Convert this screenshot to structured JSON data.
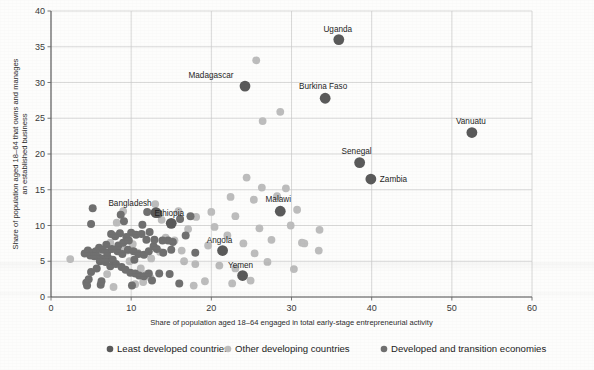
{
  "chart_data": {
    "type": "scatter",
    "title": "",
    "xlabel": "Share of population aged 18–64 engaged in total early-stage entrepreneurial activity",
    "ylabel": "Share of population aged 18–64 that owns and manages an established business",
    "ylabel_line1": "Share of population aged 18–64 that owns and manages",
    "ylabel_line2": "an established business",
    "xlim": [
      0,
      60
    ],
    "ylim": [
      0,
      40
    ],
    "xticks": [
      0,
      10,
      20,
      30,
      40,
      50,
      60
    ],
    "yticks": [
      0,
      5,
      10,
      15,
      20,
      25,
      30,
      35,
      40
    ],
    "grid": true,
    "legend_position": "bottom",
    "series": [
      {
        "name": "Least developed countries",
        "color": "#5a5a5a",
        "marker_size": 5.4,
        "points": [
          {
            "label": "Madagascar",
            "x": 24.2,
            "y": 29.5,
            "label_dx": -34,
            "label_dy": -8
          },
          {
            "label": "Uganda",
            "x": 35.9,
            "y": 36.0,
            "label_dx": -1,
            "label_dy": -8
          },
          {
            "label": "Burkina Faso",
            "x": 34.2,
            "y": 27.8,
            "label_dx": -2,
            "label_dy": -9
          },
          {
            "label": "Vanuatu",
            "x": 52.5,
            "y": 23.0,
            "label_dx": -1,
            "label_dy": -9
          },
          {
            "label": "Senegal",
            "x": 38.5,
            "y": 18.8,
            "label_dx": -3,
            "label_dy": -9
          },
          {
            "label": "Zambia",
            "x": 39.9,
            "y": 16.5,
            "label_dx": 9,
            "label_dy": 3
          },
          {
            "label": "Malawi",
            "x": 28.6,
            "y": 12.0,
            "label_dx": -2,
            "label_dy": -9
          },
          {
            "label": "Bangladesh",
            "x": 13.1,
            "y": 11.8,
            "label_dx": -26,
            "label_dy": -7
          },
          {
            "label": "Ethiopia",
            "x": 15.0,
            "y": 10.3,
            "label_dx": -2,
            "label_dy": -7
          },
          {
            "label": "Angola",
            "x": 21.4,
            "y": 6.5,
            "label_dx": -3,
            "label_dy": -8
          },
          {
            "label": "Yemen",
            "x": 23.9,
            "y": 3.0,
            "label_dx": -2,
            "label_dy": -8
          }
        ]
      },
      {
        "name": "Other developing countries",
        "color": "#bdbdbd",
        "marker_size": 3.9,
        "points": [
          {
            "x": 25.6,
            "y": 33.1
          },
          {
            "x": 28.6,
            "y": 25.9
          },
          {
            "x": 26.4,
            "y": 24.6
          },
          {
            "x": 33.5,
            "y": 9.4
          },
          {
            "x": 33.4,
            "y": 6.5
          },
          {
            "x": 31.3,
            "y": 7.6
          },
          {
            "x": 29.3,
            "y": 15.2
          },
          {
            "x": 28.2,
            "y": 14.1
          },
          {
            "x": 30.7,
            "y": 12.2
          },
          {
            "x": 29.9,
            "y": 10.0
          },
          {
            "x": 31.6,
            "y": 7.5
          },
          {
            "x": 26.3,
            "y": 15.3
          },
          {
            "x": 25.3,
            "y": 13.6
          },
          {
            "x": 24.4,
            "y": 16.7
          },
          {
            "x": 22.4,
            "y": 14.0
          },
          {
            "x": 23.0,
            "y": 11.3
          },
          {
            "x": 26.0,
            "y": 9.6
          },
          {
            "x": 27.5,
            "y": 8.0
          },
          {
            "x": 25.4,
            "y": 6.1
          },
          {
            "x": 22.0,
            "y": 8.6
          },
          {
            "x": 20.4,
            "y": 9.8
          },
          {
            "x": 19.6,
            "y": 7.2
          },
          {
            "x": 21.0,
            "y": 4.4
          },
          {
            "x": 23.0,
            "y": 4.0
          },
          {
            "x": 24.9,
            "y": 2.3
          },
          {
            "x": 22.6,
            "y": 1.9
          },
          {
            "x": 19.2,
            "y": 2.2
          },
          {
            "x": 17.8,
            "y": 1.6
          },
          {
            "x": 16.6,
            "y": 5.0
          },
          {
            "x": 18.0,
            "y": 4.6
          },
          {
            "x": 17.1,
            "y": 9.5
          },
          {
            "x": 18.1,
            "y": 11.2
          },
          {
            "x": 15.9,
            "y": 12.0
          },
          {
            "x": 14.3,
            "y": 8.3
          },
          {
            "x": 13.6,
            "y": 6.3
          },
          {
            "x": 12.5,
            "y": 5.4
          },
          {
            "x": 11.9,
            "y": 3.2
          },
          {
            "x": 12.4,
            "y": 2.7
          },
          {
            "x": 11.5,
            "y": 2.1
          },
          {
            "x": 10.5,
            "y": 1.8
          },
          {
            "x": 11.2,
            "y": 4.0
          },
          {
            "x": 10.8,
            "y": 6.2
          },
          {
            "x": 10.2,
            "y": 7.4
          },
          {
            "x": 9.5,
            "y": 6.5
          },
          {
            "x": 9.8,
            "y": 5.0
          },
          {
            "x": 8.9,
            "y": 6.9
          },
          {
            "x": 8.2,
            "y": 10.4
          },
          {
            "x": 9.0,
            "y": 12.0
          },
          {
            "x": 7.4,
            "y": 7.6
          },
          {
            "x": 7.0,
            "y": 3.2
          },
          {
            "x": 7.8,
            "y": 1.4
          },
          {
            "x": 2.4,
            "y": 5.3
          },
          {
            "x": 13.8,
            "y": 10.8
          },
          {
            "x": 15.4,
            "y": 7.9
          },
          {
            "x": 16.3,
            "y": 6.5
          },
          {
            "x": 20.0,
            "y": 11.9
          },
          {
            "x": 24.0,
            "y": 7.5
          },
          {
            "x": 27.0,
            "y": 4.9
          },
          {
            "x": 30.3,
            "y": 3.9
          },
          {
            "x": 13.0,
            "y": 13.0
          }
        ]
      },
      {
        "name": "Developed and transition economies",
        "color": "#707070",
        "marker_size": 4.0,
        "points": [
          {
            "x": 5.2,
            "y": 12.4
          },
          {
            "x": 5.0,
            "y": 10.2
          },
          {
            "x": 8.7,
            "y": 11.5
          },
          {
            "x": 9.1,
            "y": 10.6
          },
          {
            "x": 11.4,
            "y": 10.1
          },
          {
            "x": 12.3,
            "y": 9.1
          },
          {
            "x": 16.1,
            "y": 10.9
          },
          {
            "x": 17.4,
            "y": 11.3
          },
          {
            "x": 16.8,
            "y": 8.6
          },
          {
            "x": 18.0,
            "y": 6.2
          },
          {
            "x": 14.6,
            "y": 7.9
          },
          {
            "x": 15.2,
            "y": 7.7
          },
          {
            "x": 13.9,
            "y": 7.9
          },
          {
            "x": 12.8,
            "y": 7.1
          },
          {
            "x": 11.9,
            "y": 8.0
          },
          {
            "x": 11.3,
            "y": 8.8
          },
          {
            "x": 10.6,
            "y": 8.7
          },
          {
            "x": 10.0,
            "y": 9.0
          },
          {
            "x": 9.4,
            "y": 8.4
          },
          {
            "x": 8.6,
            "y": 8.9
          },
          {
            "x": 8.0,
            "y": 8.5
          },
          {
            "x": 7.5,
            "y": 8.8
          },
          {
            "x": 6.9,
            "y": 7.3
          },
          {
            "x": 6.4,
            "y": 6.6
          },
          {
            "x": 6.0,
            "y": 6.9
          },
          {
            "x": 5.6,
            "y": 6.4
          },
          {
            "x": 5.1,
            "y": 6.2
          },
          {
            "x": 4.6,
            "y": 6.5
          },
          {
            "x": 4.2,
            "y": 6.1
          },
          {
            "x": 4.9,
            "y": 5.8
          },
          {
            "x": 5.4,
            "y": 5.7
          },
          {
            "x": 5.9,
            "y": 5.6
          },
          {
            "x": 6.5,
            "y": 5.4
          },
          {
            "x": 7.1,
            "y": 5.5
          },
          {
            "x": 7.7,
            "y": 5.2
          },
          {
            "x": 8.3,
            "y": 6.4
          },
          {
            "x": 8.9,
            "y": 6.0
          },
          {
            "x": 9.6,
            "y": 6.6
          },
          {
            "x": 10.3,
            "y": 6.4
          },
          {
            "x": 10.9,
            "y": 6.0
          },
          {
            "x": 11.6,
            "y": 5.9
          },
          {
            "x": 12.2,
            "y": 6.4
          },
          {
            "x": 13.2,
            "y": 6.7
          },
          {
            "x": 14.0,
            "y": 6.2
          },
          {
            "x": 15.0,
            "y": 6.6
          },
          {
            "x": 6.1,
            "y": 5.0
          },
          {
            "x": 6.8,
            "y": 4.9
          },
          {
            "x": 7.4,
            "y": 4.3
          },
          {
            "x": 8.1,
            "y": 4.6
          },
          {
            "x": 8.8,
            "y": 4.2
          },
          {
            "x": 9.3,
            "y": 3.8
          },
          {
            "x": 9.9,
            "y": 3.4
          },
          {
            "x": 10.5,
            "y": 3.3
          },
          {
            "x": 11.0,
            "y": 3.0
          },
          {
            "x": 11.6,
            "y": 2.9
          },
          {
            "x": 12.2,
            "y": 3.3
          },
          {
            "x": 13.5,
            "y": 3.3
          },
          {
            "x": 5.0,
            "y": 3.5
          },
          {
            "x": 4.4,
            "y": 2.0
          },
          {
            "x": 4.5,
            "y": 1.6
          },
          {
            "x": 4.7,
            "y": 2.5
          },
          {
            "x": 7.0,
            "y": 6.2
          },
          {
            "x": 7.6,
            "y": 6.7
          },
          {
            "x": 8.4,
            "y": 7.2
          },
          {
            "x": 9.0,
            "y": 7.6
          },
          {
            "x": 9.7,
            "y": 7.9
          },
          {
            "x": 10.4,
            "y": 5.2
          },
          {
            "x": 12.9,
            "y": 8.0
          },
          {
            "x": 14.8,
            "y": 3.2
          },
          {
            "x": 16.0,
            "y": 1.9
          },
          {
            "x": 6.2,
            "y": 1.7
          },
          {
            "x": 6.3,
            "y": 2.2
          },
          {
            "x": 10.1,
            "y": 1.6
          },
          {
            "x": 12.6,
            "y": 2.3
          },
          {
            "x": 5.7,
            "y": 4.0
          },
          {
            "x": 12.0,
            "y": 11.9
          },
          {
            "x": 13.4,
            "y": 11.6
          }
        ]
      }
    ]
  },
  "legend": {
    "items": [
      {
        "label": "Least developed countries",
        "color": "#5a5a5a"
      },
      {
        "label": "Other developing countries",
        "color": "#bdbdbd"
      },
      {
        "label": "Developed and transition economies",
        "color": "#707070"
      }
    ]
  }
}
